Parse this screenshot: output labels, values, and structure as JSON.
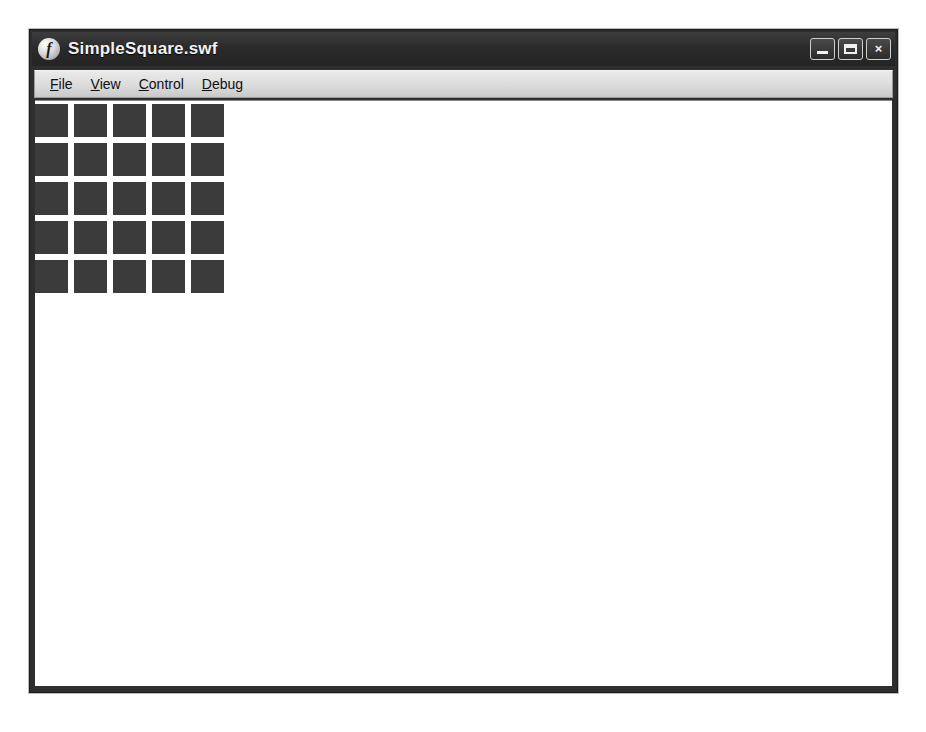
{
  "window": {
    "title": "SimpleSquare.swf",
    "app_icon": "flash-logo-icon",
    "icon_glyph": "f",
    "caption": {
      "minimize_label": "Minimize",
      "maximize_label": "Maximize",
      "close_label": "×"
    }
  },
  "menu": {
    "items": [
      {
        "label": "File",
        "accel": "F",
        "rest": "ile"
      },
      {
        "label": "View",
        "accel": "V",
        "rest": "iew"
      },
      {
        "label": "Control",
        "accel": "C",
        "rest": "ontrol"
      },
      {
        "label": "Debug",
        "accel": "D",
        "rest": "ebug"
      }
    ]
  },
  "stage": {
    "background_color": "#ffffff",
    "grid": {
      "rows": 5,
      "columns": 5,
      "cell_size_px": 33,
      "gap_px": 6,
      "square_color": "#3b3b3b",
      "total_squares": 25
    }
  },
  "colors": {
    "title_bar": "#2b2b2b",
    "menu_bar": "#dcdcdc",
    "window_frame": "#2e2e2e",
    "page_background": "#ffffff",
    "square": "#3b3b3b"
  }
}
